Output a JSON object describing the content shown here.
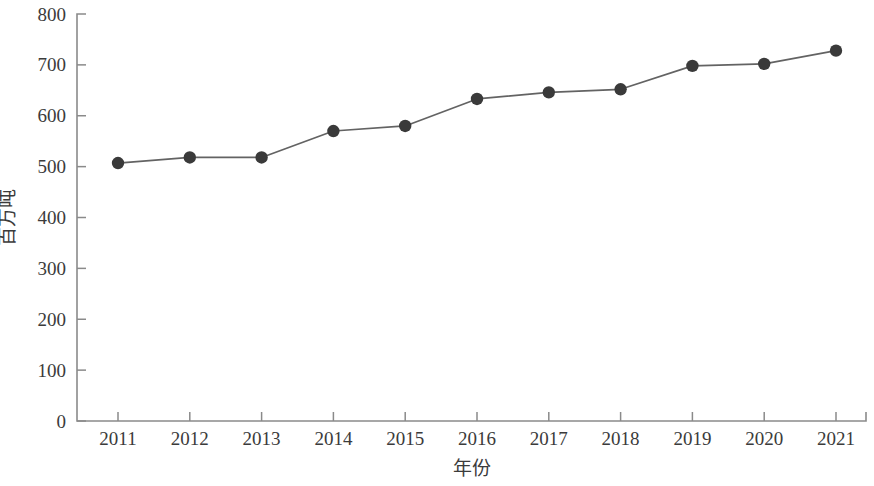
{
  "chart_data": {
    "type": "line",
    "title": "",
    "subtitle": "",
    "xlabel": "年份",
    "ylabel": "百万吨",
    "x": [
      2011,
      2012,
      2013,
      2014,
      2015,
      2016,
      2017,
      2018,
      2019,
      2020,
      2021
    ],
    "categories": [
      "2011",
      "2012",
      "2013",
      "2014",
      "2015",
      "2016",
      "2017",
      "2018",
      "2019",
      "2020",
      "2021"
    ],
    "values": [
      507,
      518,
      518,
      570,
      580,
      633,
      646,
      652,
      698,
      702,
      728
    ],
    "series": [
      {
        "name": "",
        "values": [
          507,
          518,
          518,
          570,
          580,
          633,
          646,
          652,
          698,
          702,
          728
        ]
      }
    ],
    "ylim": [
      0,
      800
    ],
    "ytick_step": 100,
    "ytick_labels": [
      "0",
      "100",
      "200",
      "300",
      "400",
      "500",
      "600",
      "700",
      "800"
    ],
    "ytick_values": [
      0,
      100,
      200,
      300,
      400,
      500,
      600,
      700,
      800
    ],
    "xtick_labels": [
      "2011",
      "2012",
      "2013",
      "2014",
      "2015",
      "2016",
      "2017",
      "2018",
      "2019",
      "2020",
      "2021"
    ],
    "grid": false,
    "legend": "none",
    "legend_position": "none",
    "marker": "circle",
    "marker_color": "#3a3a3a",
    "line_color": "#636363",
    "axis_color": "#8a8a8a",
    "background_color": "#ffffff",
    "annotations": []
  }
}
